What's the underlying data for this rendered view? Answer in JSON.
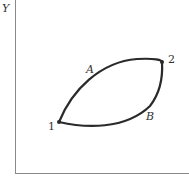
{
  "diagram": {
    "axis": {
      "y_label": "Y"
    },
    "points": [
      {
        "id": "1",
        "label": "1"
      },
      {
        "id": "2",
        "label": "2"
      }
    ],
    "paths": [
      {
        "id": "A",
        "label": "A",
        "from": "1",
        "to": "2",
        "side": "upper"
      },
      {
        "id": "B",
        "label": "B",
        "from": "1",
        "to": "2",
        "side": "lower"
      }
    ],
    "colors": {
      "curve": "#2a2a2a",
      "axis": "#888888",
      "text": "#333333"
    }
  }
}
